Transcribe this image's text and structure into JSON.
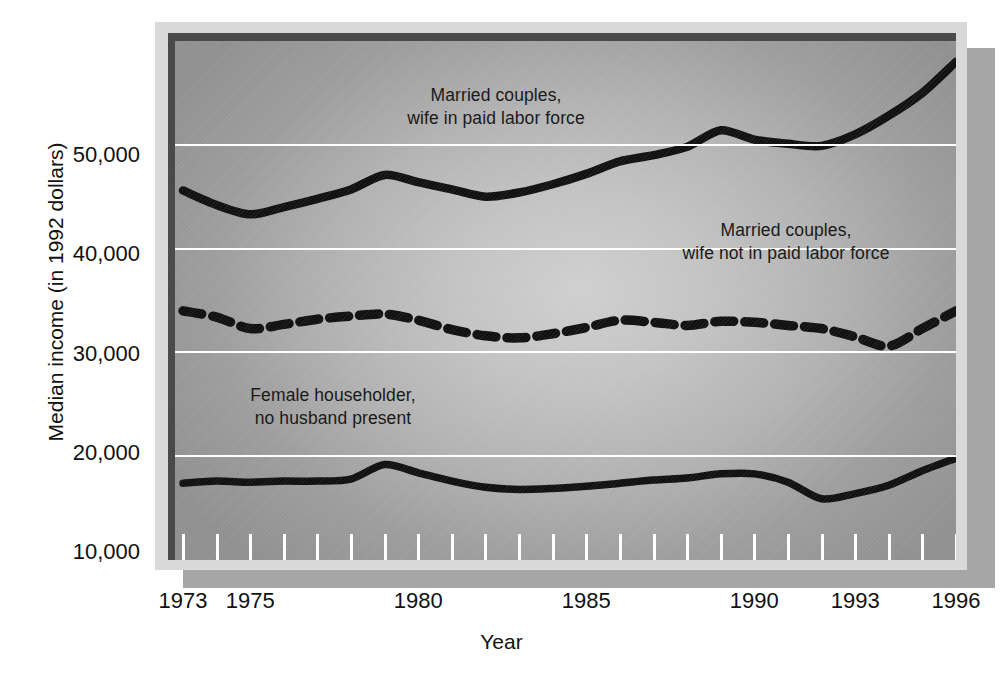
{
  "figure": {
    "yaxis_title": "Median income (in 1992 dollars)",
    "xaxis_title": "Year"
  },
  "annotations": {
    "top": "Married couples,\nwife in paid labor force",
    "middle": "Married couples,\nwife not in paid labor force",
    "bottom": "Female householder,\nno husband present"
  },
  "ytick_labels": [
    "50,000",
    "40,000",
    "30,000",
    "20,000",
    "10,000"
  ],
  "xtick_labels": [
    "1973",
    "1975",
    "1980",
    "1985",
    "1990",
    "1993",
    "1996"
  ],
  "colors": {
    "line": "#111111",
    "gridline": "#ffffff",
    "frame_outer": "#d9d9d9",
    "frame_inner": "#4a4a4a",
    "shadow": "#a6a6a6",
    "text": "#111111"
  },
  "chart_data": {
    "type": "line",
    "title": "",
    "xlabel": "Year",
    "ylabel": "Median income (in 1992 dollars)",
    "xlim": [
      1973,
      1996
    ],
    "ylim": [
      10000,
      60000
    ],
    "yticks": [
      10000,
      20000,
      30000,
      40000,
      50000
    ],
    "ytick_labels": [
      "10,000",
      "20,000",
      "30,000",
      "40,000",
      "50,000"
    ],
    "xticks_labeled": [
      1973,
      1975,
      1980,
      1985,
      1990,
      1993,
      1996
    ],
    "xticks_minor_all_years": true,
    "grid": "horizontal white gridlines at 20,000 / 30,000 / 40,000 / 50,000",
    "legend": "inline annotations on plot",
    "x": [
      1973,
      1974,
      1975,
      1976,
      1977,
      1978,
      1979,
      1980,
      1981,
      1982,
      1983,
      1984,
      1985,
      1986,
      1987,
      1988,
      1989,
      1990,
      1991,
      1992,
      1993,
      1994,
      1995,
      1996
    ],
    "series": [
      {
        "name": "Married couples, wife in paid labor force",
        "style": "solid",
        "values": [
          45600,
          44200,
          43300,
          44000,
          44800,
          45700,
          47100,
          46400,
          45700,
          45000,
          45400,
          46200,
          47200,
          48400,
          49000,
          49800,
          51400,
          50500,
          50100,
          49900,
          51000,
          52800,
          55000,
          58000
        ]
      },
      {
        "name": "Married couples, wife not in paid labor force",
        "style": "dashed",
        "values": [
          34000,
          33400,
          32300,
          32700,
          33200,
          33500,
          33700,
          33100,
          32200,
          31600,
          31400,
          31800,
          32400,
          33100,
          32900,
          32600,
          33000,
          32900,
          32600,
          32300,
          31500,
          30600,
          32300,
          34000
        ]
      },
      {
        "name": "Female householder, no husband present",
        "style": "solid",
        "values": [
          17400,
          17600,
          17500,
          17600,
          17600,
          17800,
          19200,
          18400,
          17600,
          17000,
          16800,
          16900,
          17100,
          17400,
          17700,
          17900,
          18300,
          18300,
          17500,
          15900,
          16400,
          17200,
          18600,
          19800
        ]
      }
    ]
  }
}
